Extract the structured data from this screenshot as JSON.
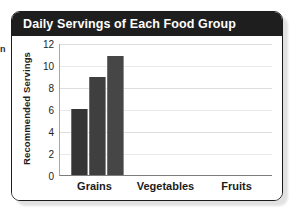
{
  "edge_fragment": "n",
  "card": {
    "title": "Daily Servings of Each Food Group",
    "header_color": "#1e1e1e",
    "border_color": "#1b1b1b",
    "background": "#ffffff"
  },
  "chart_data": {
    "type": "bar",
    "title": "Daily Servings of Each Food Group",
    "xlabel": "",
    "ylabel": "Recommended Servings",
    "categories": [
      "Grains",
      "Vegetables",
      "Fruits"
    ],
    "ylim": [
      0,
      12
    ],
    "yticks": [
      0,
      2,
      4,
      6,
      8,
      10,
      12
    ],
    "grid": true,
    "legend": "none",
    "bar_color": "#3c3c3c",
    "series": [
      {
        "name": "bar-1",
        "category": "Grains",
        "value": 6.0,
        "color": "#353535"
      },
      {
        "name": "bar-2",
        "category": "Grains",
        "value": 8.9,
        "color": "#3f3f3f"
      },
      {
        "name": "bar-3",
        "category": "Grains",
        "value": 10.8,
        "color": "#464646"
      }
    ],
    "values": [
      6.0,
      8.9,
      10.8
    ]
  }
}
